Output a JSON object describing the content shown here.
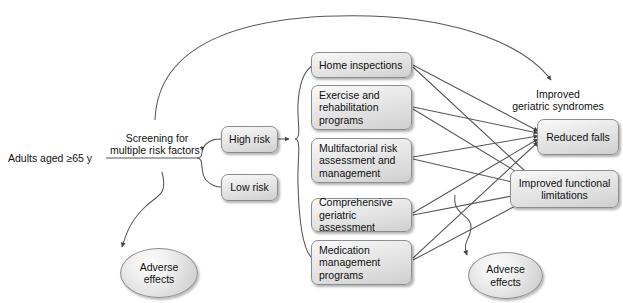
{
  "figure": {
    "type": "analytic-framework-flow-diagram",
    "background_color": "#ffffff",
    "box_fill": "#e3e3e3",
    "box_border": "#8d8d8d",
    "line_color": "#555555"
  },
  "population": {
    "label": "Adults aged ≥65 y"
  },
  "screening": {
    "label": "Screening for\nmultiple risk factors*"
  },
  "risk_strata": [
    {
      "label": "High risk"
    },
    {
      "label": "Low risk"
    }
  ],
  "interventions": [
    {
      "label": "Home inspections"
    },
    {
      "label": "Exercise and\nrehabilitation\nprograms"
    },
    {
      "label": "Multifactorial risk\nassessment and\nmanagement"
    },
    {
      "label": "Comprehensive\ngeriatric assessment"
    },
    {
      "label": "Medication\nmanagement\nprograms"
    }
  ],
  "outcomes_heading": {
    "label": "Improved\ngeriatric syndromes"
  },
  "outcomes": [
    {
      "label": "Reduced falls"
    },
    {
      "label": "Improved functional\nlimitations"
    }
  ],
  "harms": [
    {
      "label": "Adverse\neffects",
      "side": "left"
    },
    {
      "label": "Adverse\neffects",
      "side": "right"
    }
  ]
}
